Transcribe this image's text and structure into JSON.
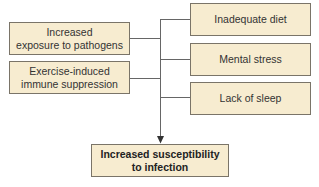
{
  "diagram": {
    "left_boxes": [
      {
        "label_line1": "Increased",
        "label_line2": "exposure to pathogens"
      },
      {
        "label_line1": "Exercise-induced",
        "label_line2": "immune suppression"
      }
    ],
    "right_boxes": [
      {
        "label": "Inadequate diet"
      },
      {
        "label": "Mental stress"
      },
      {
        "label": "Lack of sleep"
      }
    ],
    "outcome_box": {
      "label_line1": "Increased susceptibility",
      "label_line2": "to infection"
    },
    "colors": {
      "box_fill": "#f7ecd0",
      "box_border": "#7a7468",
      "line": "#666666"
    }
  }
}
